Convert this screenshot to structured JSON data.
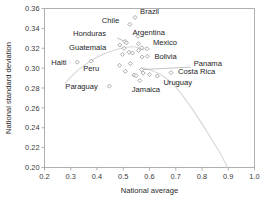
{
  "chart_data": {
    "type": "scatter",
    "title": "",
    "xlabel": "National average",
    "ylabel": "National standard deviation",
    "xlim": [
      0.2,
      1.0
    ],
    "ylim": [
      0.2,
      0.36
    ],
    "xticks": [
      "0.2",
      "0.3",
      "0.4",
      "0.5",
      "0.6",
      "0.7",
      "0.8",
      "0.9",
      "1.0"
    ],
    "xtick_values": [
      0.2,
      0.3,
      0.4,
      0.5,
      0.6,
      0.7,
      0.8,
      0.9,
      1.0
    ],
    "yticks": [
      "0.20",
      "0.22",
      "0.24",
      "0.26",
      "0.28",
      "0.30",
      "0.32",
      "0.34",
      "0.36"
    ],
    "ytick_values": [
      0.2,
      0.22,
      0.24,
      0.26,
      0.28,
      0.3,
      0.32,
      0.34,
      0.36
    ],
    "grid": false,
    "legend": "none",
    "marker": "open-diamond",
    "marker_color": "#ffffff",
    "marker_edge_color": "#8c8c8c",
    "curve_color": "#d6d6d6",
    "points": [
      {
        "label": "Haiti",
        "x": 0.325,
        "y": 0.306,
        "labeled": true,
        "label_dx": -26,
        "label_dy": 2.5,
        "leader": false
      },
      {
        "label": "Peru",
        "x": 0.378,
        "y": 0.307,
        "labeled": true,
        "label_dx": -8,
        "label_dy": 9.5,
        "leader": false
      },
      {
        "label": "Paraguay",
        "x": 0.447,
        "y": 0.2818,
        "labeled": true,
        "label_dx": -44,
        "label_dy": 3.0,
        "leader": false
      },
      {
        "label": "Guatemala",
        "x": 0.503,
        "y": 0.32,
        "labeled": true,
        "label_dx": -55,
        "label_dy": 2.0,
        "leader": false
      },
      {
        "label": "Honduras",
        "x": 0.507,
        "y": 0.3268,
        "labeled": true,
        "label_dx": -52,
        "label_dy": -5.0,
        "leader": true
      },
      {
        "label": "Chile",
        "x": 0.525,
        "y": 0.344,
        "labeled": true,
        "label_dx": -28,
        "label_dy": -1.5,
        "leader": false
      },
      {
        "label": "Brazil",
        "x": 0.545,
        "y": 0.351,
        "labeled": true,
        "label_dx": 5,
        "label_dy": -3.5,
        "leader": false
      },
      {
        "label": "Argentina",
        "x": 0.558,
        "y": 0.3245,
        "labeled": true,
        "label_dx": -6,
        "label_dy": -9.0,
        "leader": false
      },
      {
        "label": "Mexico",
        "x": 0.59,
        "y": 0.3195,
        "labeled": true,
        "label_dx": 6,
        "label_dy": -4.0,
        "leader": false
      },
      {
        "label": "Bolivia",
        "x": 0.592,
        "y": 0.312,
        "labeled": true,
        "label_dx": 7,
        "label_dy": 2.5,
        "leader": false
      },
      {
        "label": "Jamaica",
        "x": 0.563,
        "y": 0.2875,
        "labeled": true,
        "label_dx": -8,
        "label_dy": 11.0,
        "leader": false
      },
      {
        "label": "Uruguay",
        "x": 0.63,
        "y": 0.292,
        "labeled": true,
        "label_dx": 6,
        "label_dy": 8.5,
        "leader": false
      },
      {
        "label": "Costa Rica",
        "x": 0.682,
        "y": 0.2955,
        "labeled": true,
        "label_dx": 7,
        "label_dy": 1.5,
        "leader": false
      },
      {
        "label": "Panama",
        "x": 0.57,
        "y": 0.2985,
        "labeled": true,
        "label_dx": 52,
        "label_dy": -4.0,
        "leader": true
      },
      {
        "label": "",
        "x": 0.487,
        "y": 0.3232,
        "labeled": false
      },
      {
        "label": "",
        "x": 0.497,
        "y": 0.3138,
        "labeled": false
      },
      {
        "label": "",
        "x": 0.486,
        "y": 0.3028,
        "labeled": false
      },
      {
        "label": "",
        "x": 0.508,
        "y": 0.2968,
        "labeled": false
      },
      {
        "label": "",
        "x": 0.522,
        "y": 0.316,
        "labeled": false
      },
      {
        "label": "",
        "x": 0.527,
        "y": 0.3046,
        "labeled": false
      },
      {
        "label": "",
        "x": 0.535,
        "y": 0.3152,
        "labeled": false
      },
      {
        "label": "",
        "x": 0.541,
        "y": 0.293,
        "labeled": false
      },
      {
        "label": "",
        "x": 0.549,
        "y": 0.2925,
        "labeled": false
      },
      {
        "label": "",
        "x": 0.556,
        "y": 0.332,
        "labeled": false
      },
      {
        "label": "",
        "x": 0.558,
        "y": 0.3178,
        "labeled": false
      },
      {
        "label": "",
        "x": 0.571,
        "y": 0.3205,
        "labeled": false
      },
      {
        "label": "",
        "x": 0.572,
        "y": 0.3112,
        "labeled": false
      },
      {
        "label": "",
        "x": 0.576,
        "y": 0.295,
        "labeled": false
      },
      {
        "label": "",
        "x": 0.6,
        "y": 0.2935,
        "labeled": false
      },
      {
        "label": "",
        "x": 0.512,
        "y": 0.3255,
        "labeled": false
      }
    ],
    "curves": [
      {
        "name": "upper-envelope",
        "points": [
          [
            0.277,
            0.2845
          ],
          [
            0.33,
            0.2985
          ],
          [
            0.4,
            0.311
          ],
          [
            0.47,
            0.3185
          ],
          [
            0.54,
            0.3215
          ],
          [
            0.58,
            0.318
          ]
        ]
      },
      {
        "name": "lower-envelope",
        "points": [
          [
            0.575,
            0.3005
          ],
          [
            0.64,
            0.294
          ],
          [
            0.7,
            0.281
          ],
          [
            0.76,
            0.26
          ],
          [
            0.82,
            0.2355
          ],
          [
            0.87,
            0.214
          ],
          [
            0.897,
            0.2
          ]
        ]
      }
    ]
  }
}
